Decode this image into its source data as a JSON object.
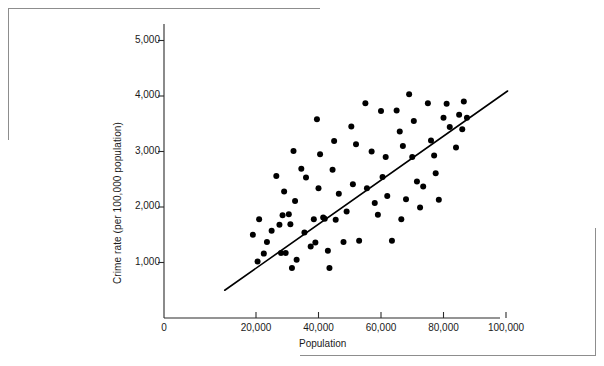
{
  "page": {
    "caption_sliver": "",
    "frame_color": "#8d8d8d"
  },
  "chart_data": {
    "type": "scatter",
    "title": "",
    "xlabel": "Population",
    "ylabel": "Crime rate (per 100,000 population)",
    "xlim": [
      0,
      104000
    ],
    "ylim": [
      0,
      5400
    ],
    "xticks": [
      0,
      20000,
      40000,
      60000,
      80000,
      100000
    ],
    "xticklabels": [
      "0",
      "20,000",
      "40,000",
      "60,000",
      "80,000",
      "100,000"
    ],
    "yticks": [
      1000,
      2000,
      3000,
      4000,
      5000
    ],
    "yticklabels": [
      "1,000",
      "2,000",
      "3,000",
      "4,000",
      "5,000"
    ],
    "grid": false,
    "legend": null,
    "marker": {
      "shape": "circle",
      "color": "#000000",
      "size_px": 4.2
    },
    "trendline": {
      "type": "linear-fit",
      "color": "#000000",
      "width_px": 1.6,
      "x_start": 10000,
      "y_start": 500,
      "x_end": 100500,
      "y_end": 4090
    },
    "points": [
      [
        19000,
        1500
      ],
      [
        20500,
        1020
      ],
      [
        21000,
        1780
      ],
      [
        22500,
        1160
      ],
      [
        23500,
        1370
      ],
      [
        25000,
        1570
      ],
      [
        26500,
        2560
      ],
      [
        27500,
        1680
      ],
      [
        28000,
        1170
      ],
      [
        28500,
        1850
      ],
      [
        29000,
        2280
      ],
      [
        29500,
        1170
      ],
      [
        30500,
        1870
      ],
      [
        31000,
        1690
      ],
      [
        31500,
        900
      ],
      [
        32000,
        3010
      ],
      [
        32500,
        2110
      ],
      [
        33000,
        1050
      ],
      [
        34500,
        2690
      ],
      [
        35500,
        1540
      ],
      [
        36000,
        2530
      ],
      [
        37500,
        1290
      ],
      [
        38500,
        1780
      ],
      [
        39000,
        1360
      ],
      [
        39500,
        3580
      ],
      [
        40000,
        2340
      ],
      [
        40500,
        2950
      ],
      [
        41500,
        1810
      ],
      [
        42000,
        1790
      ],
      [
        43000,
        1210
      ],
      [
        43500,
        900
      ],
      [
        44500,
        2670
      ],
      [
        45000,
        3190
      ],
      [
        45500,
        1770
      ],
      [
        46500,
        2240
      ],
      [
        48000,
        1370
      ],
      [
        49000,
        1920
      ],
      [
        50500,
        3450
      ],
      [
        51000,
        2410
      ],
      [
        52000,
        3130
      ],
      [
        53000,
        1390
      ],
      [
        55000,
        3870
      ],
      [
        55500,
        2340
      ],
      [
        57000,
        3000
      ],
      [
        58000,
        2070
      ],
      [
        59000,
        1860
      ],
      [
        60000,
        3730
      ],
      [
        60500,
        2540
      ],
      [
        61500,
        2900
      ],
      [
        62000,
        2200
      ],
      [
        63500,
        1390
      ],
      [
        65000,
        3740
      ],
      [
        66000,
        3360
      ],
      [
        66500,
        1780
      ],
      [
        67000,
        3100
      ],
      [
        68000,
        2140
      ],
      [
        69000,
        4030
      ],
      [
        70000,
        2900
      ],
      [
        70500,
        3550
      ],
      [
        71500,
        2460
      ],
      [
        72500,
        1990
      ],
      [
        73500,
        2370
      ],
      [
        75000,
        3870
      ],
      [
        76000,
        3200
      ],
      [
        77000,
        2930
      ],
      [
        77500,
        2610
      ],
      [
        78500,
        2130
      ],
      [
        80000,
        3610
      ],
      [
        81000,
        3860
      ],
      [
        82000,
        3440
      ],
      [
        84000,
        3070
      ],
      [
        85000,
        3660
      ],
      [
        86000,
        3400
      ],
      [
        86500,
        3900
      ],
      [
        87500,
        3610
      ]
    ],
    "n_points": 74
  }
}
